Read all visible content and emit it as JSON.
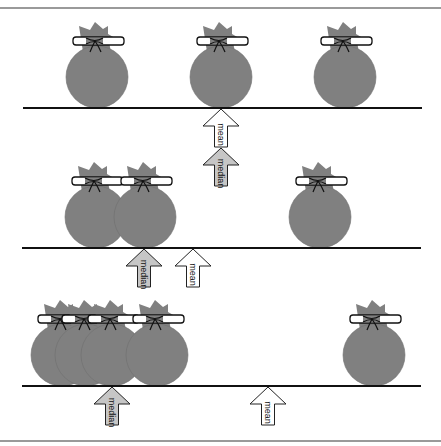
{
  "diagram": {
    "colors": {
      "bag_fill": "#808080",
      "bag_stroke": "#6e6e6e",
      "bow_fill": "#ffffff",
      "line": "#111111",
      "mean_arrow_fill": "#ffffff",
      "median_arrow_fill": "#c6c6c6",
      "arrow_stroke": "#222222",
      "frame": "#9a9a9a"
    },
    "labels": {
      "mean": "mean",
      "median": "median"
    },
    "panels": [
      {
        "id": "panel-1",
        "beam_y": 108,
        "beam_x1": 23,
        "beam_x2": 422,
        "bags_x": [
          97,
          221,
          345
        ],
        "arrows": [
          {
            "type": "mean",
            "x": 221,
            "tip_y": 109
          },
          {
            "type": "median",
            "x": 221,
            "tip_y": 148
          }
        ]
      },
      {
        "id": "panel-2",
        "beam_y": 248,
        "beam_x1": 22,
        "beam_x2": 421,
        "bags_x": [
          96,
          145,
          320
        ],
        "arrows": [
          {
            "type": "median",
            "x": 144,
            "tip_y": 249
          },
          {
            "type": "mean",
            "x": 193,
            "tip_y": 249
          }
        ]
      },
      {
        "id": "panel-3",
        "beam_y": 386,
        "beam_x1": 22,
        "beam_x2": 421,
        "bags_x": [
          62,
          86,
          112,
          157,
          374
        ],
        "arrows": [
          {
            "type": "median",
            "x": 112,
            "tip_y": 387
          },
          {
            "type": "mean",
            "x": 268,
            "tip_y": 387
          }
        ]
      }
    ]
  }
}
